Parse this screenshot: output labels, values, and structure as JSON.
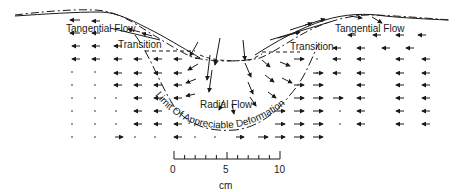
{
  "labels": {
    "tangential_left": "Tangential Flow",
    "tangential_right": "Tangential Flow",
    "transition_left": "Transition",
    "transition_right": "Transition",
    "radial": "Radial Flow",
    "limit_curve": "Limit Of Appreciable Deformation"
  },
  "scale_bar": {
    "unit": "cm",
    "ticks": [
      "0",
      "5",
      "10"
    ],
    "minor_ticks": 10
  },
  "colors": {
    "ink": "#1a1a1a",
    "background": "#ffffff"
  }
}
